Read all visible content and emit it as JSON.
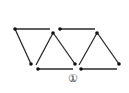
{
  "figure": {
    "label": "①",
    "stroke_color": "#2a2a2a",
    "background": "#ffffff"
  },
  "segments": [
    {
      "x1": 15,
      "y1": 29,
      "x2": 50,
      "y2": 29
    },
    {
      "x1": 15,
      "y1": 29,
      "x2": 31,
      "y2": 64
    },
    {
      "x1": 53,
      "y1": 33,
      "x2": 36,
      "y2": 65
    },
    {
      "x1": 38,
      "y1": 69,
      "x2": 73,
      "y2": 69
    },
    {
      "x1": 60,
      "y1": 29,
      "x2": 95,
      "y2": 29
    },
    {
      "x1": 54,
      "y1": 34,
      "x2": 75,
      "y2": 64
    },
    {
      "x1": 97,
      "y1": 33,
      "x2": 79,
      "y2": 65
    },
    {
      "x1": 81,
      "y1": 69,
      "x2": 117,
      "y2": 69
    },
    {
      "x1": 98,
      "y1": 34,
      "x2": 119,
      "y2": 64
    }
  ],
  "dots": [
    {
      "cx": 15,
      "cy": 29
    },
    {
      "cx": 53,
      "cy": 33
    },
    {
      "cx": 31,
      "cy": 64
    },
    {
      "cx": 38,
      "cy": 69
    },
    {
      "cx": 60,
      "cy": 29
    },
    {
      "cx": 97,
      "cy": 33
    },
    {
      "cx": 75,
      "cy": 64
    },
    {
      "cx": 81,
      "cy": 69
    },
    {
      "cx": 119,
      "cy": 64
    }
  ]
}
